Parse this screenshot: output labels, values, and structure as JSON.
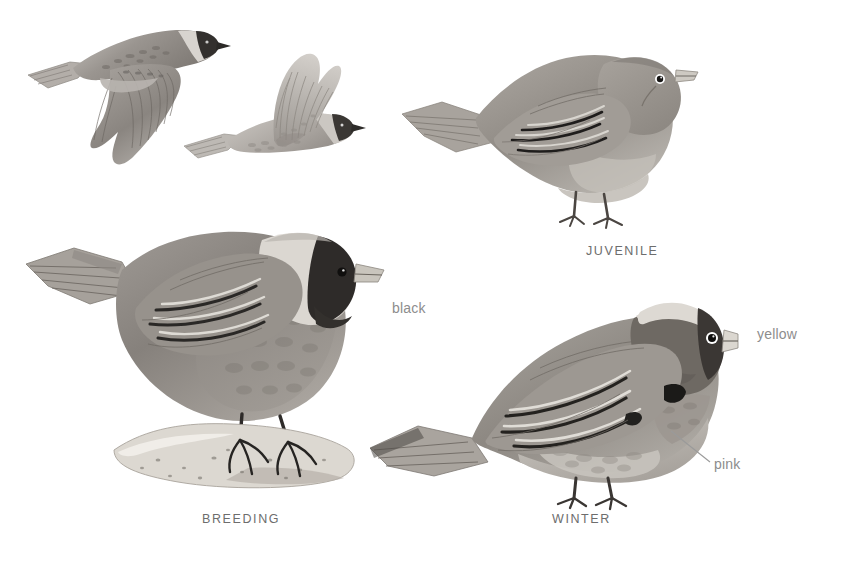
{
  "plate": {
    "title": "Rosy-Finch plumage plate",
    "background_color": "#ffffff",
    "width": 855,
    "height": 563
  },
  "palette": {
    "caption_text": "#6d6d6d",
    "annotation_text": "#8d8d8d",
    "leader_line": "#9a9a9a",
    "body_dark": "#6f6a66",
    "body_mid": "#8b8681",
    "body_light": "#b9b5b0",
    "belly_pale": "#cfcbc6",
    "cap_black": "#2f2c2a",
    "crown_pale": "#dedad5",
    "bill_pale": "#d8d4cd",
    "wing_bar": "#1e1c1b",
    "rock_light": "#ddd9d2",
    "rock_shade": "#b0aba3",
    "eye_black": "#141313",
    "eye_ring": "#ffffff",
    "leg_dark": "#3a3634"
  },
  "figures": [
    {
      "id": "flight-upperside",
      "name": "bird-in-flight-upperside",
      "pose": "flying, wings swept down, viewed from above, head to the right",
      "has_black_face": true
    },
    {
      "id": "flight-underside",
      "name": "bird-in-flight-underside",
      "pose": "flying, wings raised up, paler underside, head to the right",
      "has_black_face": true
    },
    {
      "id": "juvenile",
      "name": "juvenile-bird",
      "pose": "perched, facing right, plain grayish-brown, no black cap",
      "caption": "JUVENILE"
    },
    {
      "id": "breeding",
      "name": "breeding-adult-bird",
      "pose": "perched on rock, facing right, black forehead and face, pale gray crown",
      "caption": "BREEDING"
    },
    {
      "id": "winter",
      "name": "winter-adult-bird",
      "pose": "perched, facing right, dark brown cap, pale gray nape, pale bill",
      "caption": "WINTER"
    }
  ],
  "captions": [
    {
      "text": "JUVENILE",
      "x": 586,
      "y": 244
    },
    {
      "text": "BREEDING",
      "x": 202,
      "y": 512
    },
    {
      "text": "WINTER",
      "x": 552,
      "y": 512
    }
  ],
  "annotations": [
    {
      "id": "black",
      "text": "black",
      "x": 392,
      "y": 300,
      "refers_to": "black forehead and face of breeding adult",
      "has_leader_line": false
    },
    {
      "id": "yellow",
      "text": "yellow",
      "x": 757,
      "y": 326,
      "refers_to": "yellow bill of winter adult",
      "has_leader_line": false
    },
    {
      "id": "pink",
      "text": "pink",
      "x": 714,
      "y": 456,
      "refers_to": "pink wash on flanks and wing of winter adult",
      "has_leader_line": true,
      "leader_from_x": 671,
      "leader_from_y": 431,
      "leader_to_x": 710,
      "leader_to_y": 462
    }
  ]
}
